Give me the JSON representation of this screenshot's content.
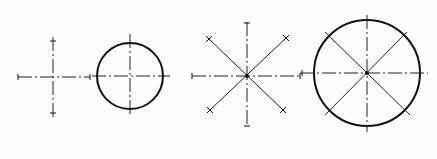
{
  "diagram": {
    "type": "technical-drawing-centerlines",
    "colors": {
      "line": "#222222",
      "outline": "#111111",
      "background": "#fdfdfd"
    },
    "figures": [
      {
        "id": "cross-centerlines",
        "description": "Two perpendicular dash-dot center lines with end ticks",
        "center": [
          53,
          77
        ],
        "horizontal": {
          "x1": 18,
          "x2": 90,
          "y": 77
        },
        "vertical": {
          "x": 53,
          "y1": 37,
          "y2": 118
        }
      },
      {
        "id": "circle-with-centerlines",
        "description": "Circle with perpendicular center lines",
        "center": [
          130,
          76
        ],
        "radius": 33,
        "horizontal": {
          "x1": 92,
          "x2": 170,
          "y": 76
        },
        "vertical": {
          "x": 130,
          "y1": 34,
          "y2": 117
        }
      },
      {
        "id": "eight-way-centerlines",
        "description": "Horizontal, vertical and two diagonal lines through a center point with end ticks",
        "center": [
          247,
          76
        ],
        "horizontal": {
          "x1": 192,
          "x2": 302,
          "y": 76
        },
        "vertical": {
          "x": 247,
          "y1": 22,
          "y2": 127
        },
        "diagonals": [
          {
            "x1": 208,
            "y1": 38,
            "x2": 283,
            "y2": 110
          },
          {
            "x1": 287,
            "y1": 37,
            "x2": 210,
            "y2": 110
          }
        ]
      },
      {
        "id": "circle-eight-way",
        "description": "Circle with horizontal, vertical and diagonal lines through the center",
        "center": [
          367,
          73
        ],
        "radius": 53,
        "horizontal": {
          "x1": 300,
          "x2": 428,
          "y": 73
        },
        "vertical": {
          "x": 367,
          "y1": 15,
          "y2": 132
        },
        "diagonals": [
          {
            "x1": 325,
            "y1": 32,
            "x2": 410,
            "y2": 115
          },
          {
            "x1": 407,
            "y1": 32,
            "x2": 325,
            "y2": 115
          }
        ]
      }
    ]
  }
}
